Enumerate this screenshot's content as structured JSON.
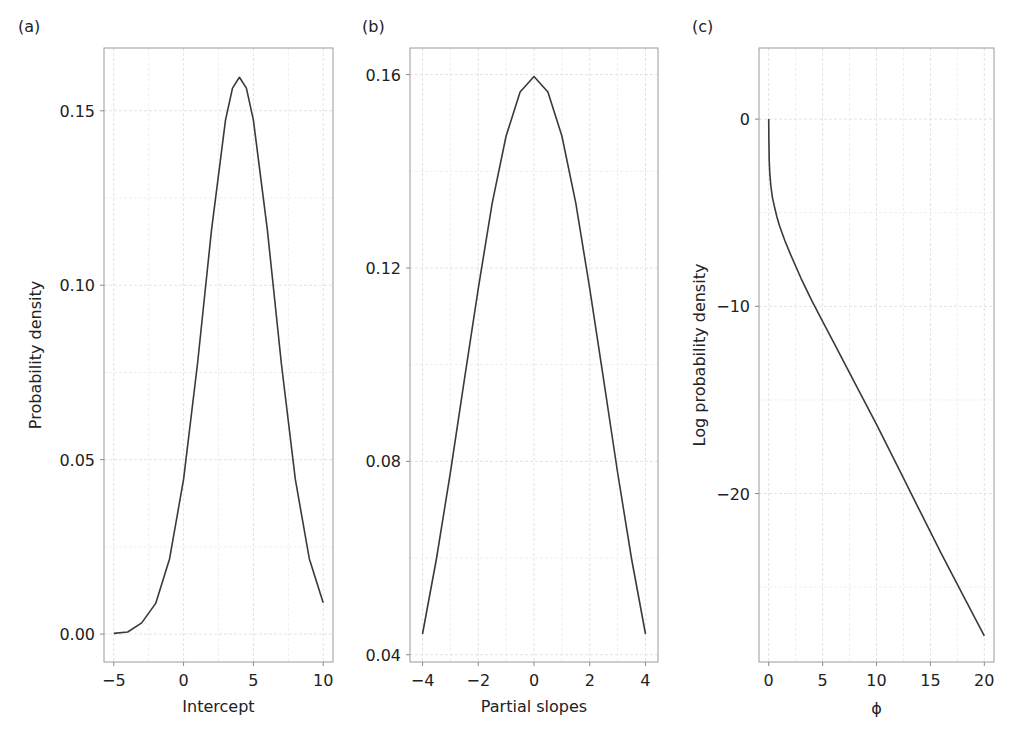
{
  "figure": {
    "panels": [
      {
        "id": "a",
        "label": "(a)"
      },
      {
        "id": "b",
        "label": "(b)"
      },
      {
        "id": "c",
        "label": "(c)"
      }
    ]
  },
  "colors": {
    "curve": "#3a3a3a",
    "frame": "#9a9a9a",
    "grid": "#e3e3e3",
    "text": "#222222"
  },
  "chart_data": [
    {
      "panel": "(a)",
      "type": "line",
      "title": "",
      "xlabel": "Intercept",
      "ylabel": "Probability density",
      "xlim": [
        -5.7,
        10.7
      ],
      "ylim": [
        -0.008,
        0.168
      ],
      "xticks": [
        -5,
        0,
        5,
        10
      ],
      "xtick_labels": [
        "−5",
        "0",
        "5",
        "10"
      ],
      "yticks": [
        0.0,
        0.05,
        0.1,
        0.15
      ],
      "ytick_labels": [
        "0.00",
        "0.05",
        "0.10",
        "0.15"
      ],
      "xminor": [
        -2.5,
        2.5,
        7.5
      ],
      "yminor": [
        0.025,
        0.075,
        0.125
      ],
      "grid": true,
      "legend": null,
      "series": [
        {
          "name": "density",
          "x": [
            -5,
            -4,
            -3,
            -2,
            -1,
            0,
            1,
            2,
            3,
            3.5,
            4,
            4.5,
            5,
            6,
            7,
            8,
            9,
            10
          ],
          "y": [
            0.0002,
            0.0006,
            0.0032,
            0.0088,
            0.0216,
            0.0444,
            0.0777,
            0.1158,
            0.1473,
            0.1565,
            0.1596,
            0.1565,
            0.1473,
            0.1158,
            0.0777,
            0.0444,
            0.0216,
            0.009
          ]
        }
      ]
    },
    {
      "panel": "(b)",
      "type": "line",
      "title": "",
      "xlabel": "Partial slopes",
      "ylabel": "",
      "xlim": [
        -4.45,
        4.45
      ],
      "ylim": [
        0.0385,
        0.1655
      ],
      "xticks": [
        -4,
        -2,
        0,
        2,
        4
      ],
      "xtick_labels": [
        "−4",
        "−2",
        "0",
        "2",
        "4"
      ],
      "yticks": [
        0.04,
        0.08,
        0.12,
        0.16
      ],
      "ytick_labels": [
        "0.04",
        "0.08",
        "0.12",
        "0.16"
      ],
      "xminor": [
        -3,
        -1,
        1,
        3
      ],
      "yminor": [
        0.06,
        0.1,
        0.14
      ],
      "grid": true,
      "legend": null,
      "series": [
        {
          "name": "density",
          "x": [
            -4,
            -3.5,
            -3,
            -2.5,
            -2,
            -1.5,
            -1,
            -0.5,
            0,
            0.5,
            1,
            1.5,
            2,
            2.5,
            3,
            3.5,
            4
          ],
          "y": [
            0.0443,
            0.0599,
            0.0777,
            0.0968,
            0.1158,
            0.1334,
            0.1473,
            0.1564,
            0.1596,
            0.1564,
            0.1473,
            0.1334,
            0.1158,
            0.0968,
            0.0777,
            0.0599,
            0.0443
          ]
        }
      ]
    },
    {
      "panel": "(c)",
      "type": "line",
      "title": "",
      "xlabel": "ϕ",
      "ylabel": "Log probability density",
      "xlim": [
        -0.9,
        20.9
      ],
      "ylim": [
        -29.0,
        3.8
      ],
      "xticks": [
        0,
        5,
        10,
        15,
        20
      ],
      "xtick_labels": [
        "0",
        "5",
        "10",
        "15",
        "20"
      ],
      "yticks": [
        0,
        -10,
        -20
      ],
      "ytick_labels": [
        "0",
        "−10",
        "−20"
      ],
      "xminor": [
        2.5,
        7.5,
        12.5,
        17.5
      ],
      "yminor": [
        -5,
        -15,
        -25
      ],
      "grid": true,
      "legend": null,
      "series": [
        {
          "name": "log density",
          "x": [
            0.0,
            0.02,
            0.05,
            0.1,
            0.2,
            0.35,
            0.5,
            0.75,
            1,
            1.5,
            2,
            3,
            4,
            5,
            6,
            8,
            10,
            12,
            14,
            16,
            18,
            20
          ],
          "y": [
            0.0,
            -1.2,
            -2.2,
            -2.9,
            -3.6,
            -4.2,
            -4.6,
            -5.2,
            -5.7,
            -6.5,
            -7.2,
            -8.5,
            -9.7,
            -10.8,
            -11.9,
            -14.1,
            -16.3,
            -18.6,
            -20.9,
            -23.2,
            -25.4,
            -27.6
          ]
        }
      ]
    }
  ]
}
